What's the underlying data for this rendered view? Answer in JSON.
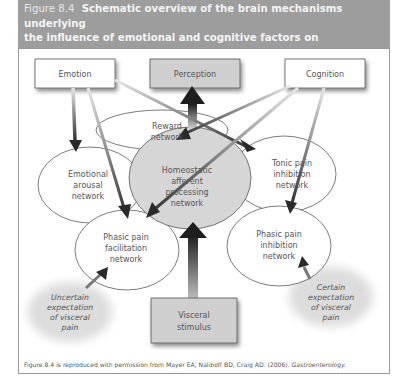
{
  "header": {
    "figure_number": "Figure 8.4",
    "title": "Schematic overview of the brain mechanisms underlying the influence of emotional and cognitive factors on processing and perception of visceral sensory signals",
    "title_line1": "Schematic overview of the brain mechanisms underlying",
    "title_line2": "the influence of emotional and cognitive factors on processing and",
    "title_line3": "perception of visceral sensory signals"
  },
  "diagram": {
    "boxes": {
      "emotion": "Emotion",
      "perception": "Perception",
      "cognition": "Cognition",
      "visceral_stimulus_line1": "Visceral",
      "visceral_stimulus_line2": "stimulus"
    },
    "networks": {
      "reward": [
        "Reward",
        "network"
      ],
      "emotional_arousal": [
        "Emotional",
        "arousal",
        "network"
      ],
      "homeostatic": [
        "Homeostatic",
        "afferent",
        "processing",
        "network"
      ],
      "tonic_pain_inhibition": [
        "Tonic pain",
        "inhibition",
        "network"
      ],
      "phasic_pain_facilitation": [
        "Phasic pain",
        "facilitation",
        "network"
      ],
      "phasic_pain_inhibition": [
        "Phasic pain",
        "inhibition",
        "network"
      ]
    },
    "expectations": {
      "uncertain": [
        "Uncertain",
        "expectation",
        "of visceral",
        "pain"
      ],
      "certain": [
        "Certain",
        "expectation",
        "of visceral",
        "pain"
      ]
    },
    "colors": {
      "header_bg": "#9d9d9d",
      "gray_box": "#cfcfcf",
      "homeostatic_fill": "#d6d6d6",
      "arrow_dark": "#2a2a2a",
      "cloud": "#e8e8e8"
    }
  },
  "caption": {
    "text": "Figure 8.4 is reproduced with permission from Mayer EA, Naliboff BD, Craig AD. (2006).",
    "journal": "Gastroenterology."
  }
}
